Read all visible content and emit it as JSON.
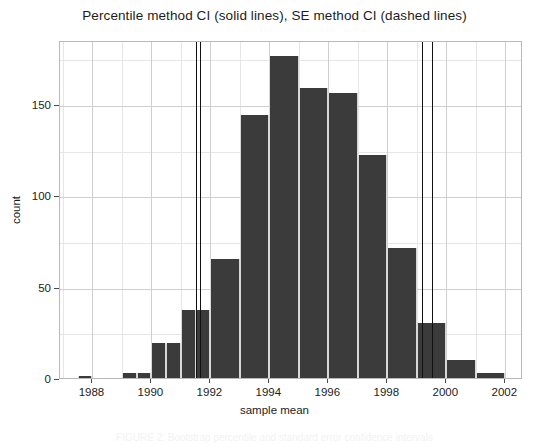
{
  "figure": {
    "title": "Percentile method CI (solid lines), SE method CI (dashed lines)",
    "xlabel": "sample mean",
    "ylabel": "count",
    "caption": "FIGURE 2: Bootstrap percentile and standard error confidence intervals"
  },
  "chart_data": {
    "type": "bar",
    "title": "Percentile method CI (solid lines), SE method CI (dashed lines)",
    "xlabel": "sample mean",
    "ylabel": "count",
    "xlim": [
      1986.9,
      2002.6
    ],
    "ylim": [
      0,
      185
    ],
    "grid": true,
    "legend": "none",
    "bin_width": 0.5,
    "bar_color": "#3b3b3b",
    "categories": [
      "1987.5",
      "1989.0",
      "1989.5",
      "1990.5",
      "1991.0",
      "1991.5",
      "1992.0",
      "1992.5",
      "1993.0",
      "1993.5",
      "1994.0",
      "1994.5",
      "1995.0",
      "1995.5",
      "1996.0",
      "1996.5",
      "1997.0",
      "1997.5",
      "1998.5",
      "1999.0",
      "1999.5",
      "2000.5",
      "2001.5"
    ],
    "bins": [
      {
        "x0": 1987.5,
        "x1": 1988.0,
        "count": 1
      },
      {
        "x0": 1989.0,
        "x1": 1989.5,
        "count": 3
      },
      {
        "x0": 1989.5,
        "x1": 1990.0,
        "count": 3
      },
      {
        "x0": 1990.0,
        "x1": 1990.5,
        "count": 19
      },
      {
        "x0": 1990.5,
        "x1": 1991.0,
        "count": 19
      },
      {
        "x0": 1991.0,
        "x1": 1991.5,
        "count": 37
      },
      {
        "x0": 1991.5,
        "x1": 1992.0,
        "count": 37
      },
      {
        "x0": 1992.0,
        "x1": 1993.0,
        "count": 65
      },
      {
        "x0": 1993.0,
        "x1": 1994.0,
        "count": 144
      },
      {
        "x0": 1994.0,
        "x1": 1995.0,
        "count": 176
      },
      {
        "x0": 1995.0,
        "x1": 1996.0,
        "count": 159
      },
      {
        "x0": 1996.0,
        "x1": 1997.0,
        "count": 156
      },
      {
        "x0": 1997.0,
        "x1": 1998.0,
        "count": 122
      },
      {
        "x0": 1998.0,
        "x1": 1999.0,
        "count": 71
      },
      {
        "x0": 1999.0,
        "x1": 2000.0,
        "count": 30
      },
      {
        "x0": 2000.0,
        "x1": 2001.0,
        "count": 10
      },
      {
        "x0": 2001.0,
        "x1": 2002.0,
        "count": 3
      }
    ],
    "xticks": [
      1988,
      1990,
      1992,
      1994,
      1996,
      1998,
      2000,
      2002
    ],
    "xtick_labels": [
      "1988",
      "1990",
      "1992",
      "1994",
      "1996",
      "1998",
      "2000",
      "2002"
    ],
    "yticks": [
      0,
      50,
      100,
      150
    ],
    "ytick_labels": [
      "0",
      "50",
      "100",
      "150"
    ],
    "y_minor_ticks": [
      25,
      75,
      125,
      175
    ],
    "x_minor_ticks": [
      1987,
      1989,
      1991,
      1993,
      1995,
      1997,
      1999,
      2001
    ],
    "annotations": [
      {
        "name": "percentile-ci-lower",
        "type": "vline",
        "x": 1991.52,
        "style": "solid"
      },
      {
        "name": "se-ci-lower",
        "type": "vline",
        "x": 1991.66,
        "style": "dashed"
      },
      {
        "name": "se-ci-upper",
        "type": "vline",
        "x": 1999.17,
        "style": "dashed"
      },
      {
        "name": "percentile-ci-upper",
        "type": "vline",
        "x": 1999.5,
        "style": "solid"
      }
    ]
  }
}
